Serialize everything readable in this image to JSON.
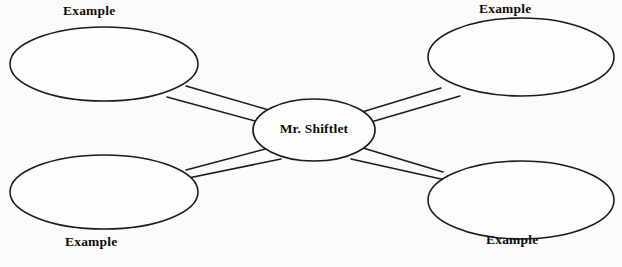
{
  "diagram": {
    "type": "concept-map",
    "background_color": "#fbfbfa",
    "stroke_color": "#1a1a1a",
    "text_color": "#0d0d0d",
    "center": {
      "id": "center",
      "label": "Mr. Shiftlet",
      "shape": "ellipse",
      "cx": 314,
      "cy": 130,
      "rx": 61,
      "ry": 31
    },
    "nodes": [
      {
        "id": "top-left",
        "label": "Example",
        "shape": "ellipse",
        "cx": 104,
        "cy": 64,
        "rx": 94,
        "ry": 37,
        "label_position": "above"
      },
      {
        "id": "top-right",
        "label": "Example",
        "shape": "ellipse",
        "cx": 521,
        "cy": 57,
        "rx": 93,
        "ry": 39,
        "label_position": "above"
      },
      {
        "id": "bottom-left",
        "label": "Example",
        "shape": "ellipse",
        "cx": 104,
        "cy": 192,
        "rx": 94,
        "ry": 37,
        "label_position": "below"
      },
      {
        "id": "bottom-right",
        "label": "Example",
        "shape": "ellipse",
        "cx": 521,
        "cy": 200,
        "rx": 93,
        "ry": 39,
        "label_position": "below"
      }
    ],
    "connectors": [
      {
        "id": "connector-top-left",
        "from": "top-left",
        "to": "center",
        "style": "double-line",
        "lines": [
          {
            "x1": 186,
            "y1": 86,
            "x2": 269,
            "y2": 110
          },
          {
            "x1": 167,
            "y1": 97,
            "x2": 259,
            "y2": 122
          }
        ]
      },
      {
        "id": "connector-top-right",
        "from": "center",
        "to": "top-right",
        "style": "double-line",
        "lines": [
          {
            "x1": 362,
            "y1": 112,
            "x2": 441,
            "y2": 88
          },
          {
            "x1": 371,
            "y1": 122,
            "x2": 460,
            "y2": 96
          }
        ]
      },
      {
        "id": "connector-bottom-left",
        "from": "bottom-left",
        "to": "center",
        "style": "double-line",
        "lines": [
          {
            "x1": 186,
            "y1": 170,
            "x2": 269,
            "y2": 148
          },
          {
            "x1": 169,
            "y1": 182,
            "x2": 281,
            "y2": 159
          }
        ]
      },
      {
        "id": "connector-bottom-right",
        "from": "center",
        "to": "bottom-right",
        "style": "double-line",
        "lines": [
          {
            "x1": 363,
            "y1": 148,
            "x2": 443,
            "y2": 172
          },
          {
            "x1": 351,
            "y1": 159,
            "x2": 459,
            "y2": 183
          }
        ]
      }
    ]
  }
}
